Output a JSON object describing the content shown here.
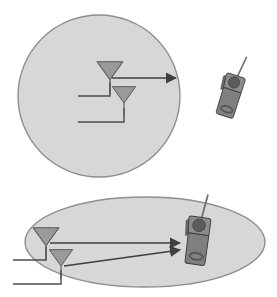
{
  "figure": {
    "width": 277,
    "height": 297,
    "background_color": "#ffffff",
    "caption": ""
  },
  "colors": {
    "cell_fill": "#d7d7d7",
    "cell_stroke": "#8f8f8f",
    "antenna_fill": "#9a9a9a",
    "antenna_stroke": "#555555",
    "line_stroke": "#4d4d4d",
    "phone_body": "#8c8c8c",
    "phone_body_dark": "#7a7a7a",
    "phone_stroke": "#3f3f3f",
    "phone_earpiece": "#5c5c5c",
    "phone_keypad": "#6b6b6b",
    "phone_antenna": "#707070"
  },
  "panels": [
    {
      "id": "top-panel",
      "name": "circular-coverage-panel",
      "cell_shape": "circle",
      "label": "",
      "cell": {
        "cx": 99,
        "cy": 96,
        "rx": 81,
        "ry": 81
      },
      "antennas": [
        {
          "id": "antenna-upper",
          "label": ""
        },
        {
          "id": "antenna-lower",
          "label": ""
        }
      ],
      "beams": [
        {
          "id": "beam-main",
          "label": "",
          "arrow": true
        }
      ],
      "phone": {
        "id": "handset-outside",
        "label": "",
        "rotation": 18
      }
    },
    {
      "id": "bottom-panel",
      "name": "elliptical-coverage-panel",
      "cell_shape": "ellipse",
      "label": "",
      "cell": {
        "cx": 145,
        "cy": 242,
        "rx": 120,
        "ry": 45
      },
      "antennas": [
        {
          "id": "antenna-upper",
          "label": ""
        },
        {
          "id": "antenna-lower",
          "label": ""
        }
      ],
      "beams": [
        {
          "id": "beam-upper",
          "label": "",
          "arrow": true
        },
        {
          "id": "beam-lower",
          "label": "",
          "arrow": true
        }
      ],
      "phone": {
        "id": "handset-inside",
        "label": "",
        "rotation": 8
      }
    }
  ]
}
